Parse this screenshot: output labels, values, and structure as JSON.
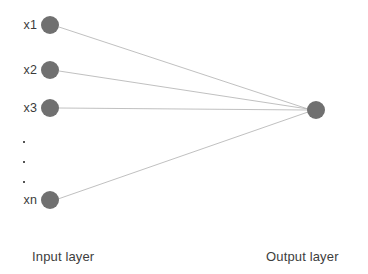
{
  "diagram": {
    "type": "neural-network-architecture",
    "background_color": "#ffffff",
    "node_color": "#707070",
    "node_radius": 9,
    "edge_color": "#b0b0b0",
    "edge_width": 0.8,
    "label_color": "#3b3b3b",
    "caption_color": "#3d3d3d",
    "canvas": {
      "width": 368,
      "height": 274
    }
  },
  "input_layer": {
    "caption": "Input layer",
    "caption_x": 32,
    "caption_y": 250,
    "node_x": 50,
    "nodes": [
      {
        "id": "x1",
        "label": "x1",
        "cx": 50,
        "cy": 25
      },
      {
        "id": "x2",
        "label": "x2",
        "cx": 50,
        "cy": 70
      },
      {
        "id": "x3",
        "label": "x3",
        "cx": 50,
        "cy": 108
      },
      {
        "id": "xn",
        "label": "xn",
        "cx": 50,
        "cy": 200
      }
    ],
    "ellipsis": {
      "name": "vertical-ellipsis",
      "dots": [
        {
          "x": 23,
          "y": 141
        },
        {
          "x": 23,
          "y": 161
        },
        {
          "x": 23,
          "y": 181
        }
      ]
    }
  },
  "output_layer": {
    "caption": "Output layer",
    "caption_x": 266,
    "caption_y": 250,
    "nodes": [
      {
        "id": "y",
        "label": "",
        "cx": 316,
        "cy": 110
      }
    ]
  },
  "edges": [
    {
      "from": "x1",
      "to": "y",
      "x1": 59,
      "y1": 27,
      "x2": 308,
      "y2": 109
    },
    {
      "from": "x2",
      "to": "y",
      "x1": 59,
      "y1": 71,
      "x2": 308,
      "y2": 109
    },
    {
      "from": "x3",
      "to": "y",
      "x1": 59,
      "y1": 108,
      "x2": 308,
      "y2": 110
    },
    {
      "from": "xn",
      "to": "y",
      "x1": 58,
      "y1": 199,
      "x2": 308,
      "y2": 112
    }
  ]
}
